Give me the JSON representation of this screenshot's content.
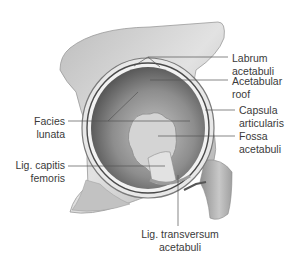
{
  "figure": {
    "colors": {
      "background": "#ffffff",
      "bone": "#d9d9d9",
      "bone_shadow": "#9a9a9a",
      "socket_dark": "#5f5f5f",
      "socket_light": "#b8b8b8",
      "fossa": "#cfcfcf",
      "leader_line": "#555555",
      "label_text": "#3a3a3a"
    }
  },
  "labels": {
    "labrum": {
      "line1": "Labrum",
      "line2": "acetabuli"
    },
    "roof": {
      "line1": "Acetabular",
      "line2": "roof"
    },
    "capsula": {
      "line1": "Capsula",
      "line2": "articularis"
    },
    "fossa": {
      "line1": "Fossa",
      "line2": "acetabuli"
    },
    "facies": {
      "line1": "Facies",
      "line2": "lunata"
    },
    "lig_capitis": {
      "line1": "Lig. capitis",
      "line2": "femoris"
    },
    "lig_transversum": {
      "line1": "Lig. transversum",
      "line2": "acetabuli"
    }
  }
}
